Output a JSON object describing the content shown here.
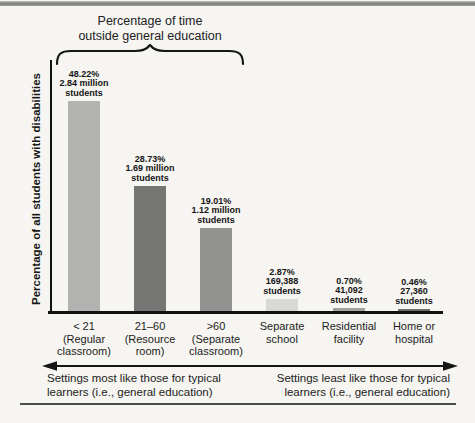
{
  "chart_data": {
    "type": "bar",
    "title": "Percentage of time outside general education",
    "ylabel": "Percentage of all students with disabilities",
    "xlabel": "",
    "ylim": [
      0,
      50
    ],
    "grid": false,
    "legend": false,
    "categories": [
      "< 21 (Regular classroom)",
      "21–60 (Resource room)",
      ">60 (Separate classroom)",
      "Separate school",
      "Residential facility",
      "Home or hospital"
    ],
    "values": [
      48.22,
      28.73,
      19.01,
      2.87,
      0.7,
      0.46
    ],
    "counts": [
      "2.84 million students",
      "1.69 million students",
      "1.12 million students",
      "169,388 students",
      "41,092 students",
      "27,360 students"
    ],
    "brace": {
      "label_lines": [
        "Percentage of time",
        "outside general education"
      ],
      "covers_categories": [
        0,
        1,
        2
      ]
    },
    "bars": [
      {
        "value": 48.22,
        "percent_label": "48.22%",
        "count_lines": [
          "2.84 million",
          "students"
        ],
        "category_lines": [
          "< 21",
          "(Regular",
          "classroom)"
        ],
        "color": "#b2b2b0"
      },
      {
        "value": 28.73,
        "percent_label": "28.73%",
        "count_lines": [
          "1.69 million",
          "students"
        ],
        "category_lines": [
          "21–60",
          "(Resource",
          "room)"
        ],
        "color": "#757573"
      },
      {
        "value": 19.01,
        "percent_label": "19.01%",
        "count_lines": [
          "1.12 million",
          "students"
        ],
        "category_lines": [
          ">60",
          "(Separate",
          "classroom)"
        ],
        "color": "#929290"
      },
      {
        "value": 2.87,
        "percent_label": "2.87%",
        "count_lines": [
          "169,388",
          "students"
        ],
        "category_lines": [
          "Separate",
          "school"
        ],
        "color": "#d8d8d4"
      },
      {
        "value": 0.7,
        "percent_label": "0.70%",
        "count_lines": [
          "41,092",
          "students"
        ],
        "category_lines": [
          "Residential",
          "facility"
        ],
        "color": "#a2a2a0"
      },
      {
        "value": 0.46,
        "percent_label": "0.46%",
        "count_lines": [
          "27,360",
          "students"
        ],
        "category_lines": [
          "Home or",
          "hospital"
        ],
        "color": "#6e6e6c"
      }
    ]
  },
  "footer": {
    "left_lines": [
      "Settings most like those for typical",
      "learners (i.e., general education)"
    ],
    "right_lines": [
      "Settings least like those for typical",
      "learners (i.e., general education)"
    ]
  },
  "colors": {
    "axis": "#111111",
    "text": "#1f1f1f",
    "top_band": "#868684"
  }
}
